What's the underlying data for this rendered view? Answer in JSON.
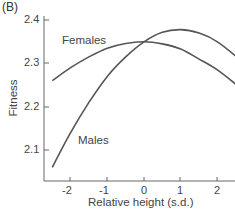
{
  "panel_label": "(B)",
  "chart_data": {
    "type": "line",
    "title": "",
    "xlabel": "Relative height (s.d.)",
    "ylabel": "Fitness",
    "x_ticks": [
      "-2",
      "-1",
      "0",
      "1",
      "2"
    ],
    "y_ticks": [
      "2.1",
      "2.2",
      "2.3",
      "2.4"
    ],
    "xlim": [
      -2.7,
      2.6
    ],
    "ylim": [
      2.03,
      2.41
    ],
    "grid": false,
    "legend": "inline labels",
    "series": [
      {
        "name": "Females",
        "x": [
          -2.5,
          -2,
          -1.5,
          -1,
          -0.5,
          0,
          0.5,
          1,
          1.5,
          2,
          2.6
        ],
        "values": [
          2.26,
          2.29,
          2.315,
          2.335,
          2.346,
          2.35,
          2.345,
          2.333,
          2.31,
          2.285,
          2.245
        ]
      },
      {
        "name": "Males",
        "x": [
          -2.5,
          -2,
          -1.5,
          -1,
          -0.5,
          0,
          0.5,
          1,
          1.5,
          2,
          2.6
        ],
        "values": [
          2.06,
          2.14,
          2.21,
          2.27,
          2.315,
          2.35,
          2.372,
          2.378,
          2.37,
          2.35,
          2.31
        ]
      }
    ]
  },
  "labels": {
    "females": "Females",
    "males": "Males"
  }
}
